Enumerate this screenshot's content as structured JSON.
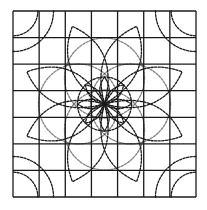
{
  "diagram": {
    "title": "",
    "type": "quilt-block-pattern",
    "grid": {
      "rows": 7,
      "cols": 7,
      "x0": 13,
      "y0": 11,
      "x1": 196,
      "y1": 197
    },
    "center": [
      104.5,
      104
    ],
    "colors": {
      "line": "#1a1a1a",
      "background": "#ffffff"
    },
    "elements": {
      "outer_petals": 8,
      "inner_rosette_petals": 8,
      "center_circle": true,
      "corner_arcs_per_corner": 2
    }
  }
}
